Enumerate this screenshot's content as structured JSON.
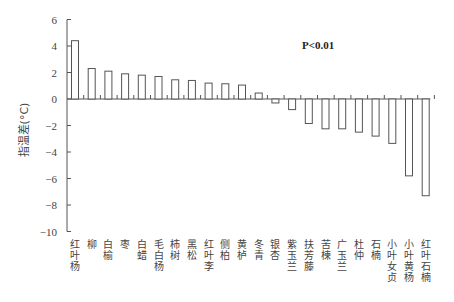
{
  "chart_data": {
    "type": "bar",
    "title": "",
    "xlabel": "",
    "ylabel": "指温差(°C)",
    "ylim": [
      -10,
      6
    ],
    "yticks": [
      6,
      4,
      2,
      0,
      -2,
      -4,
      -6,
      -8,
      -10
    ],
    "grid": false,
    "legend": null,
    "annotation": "P<0.01",
    "categories": [
      "红叶杨",
      "柳",
      "白榆",
      "枣",
      "白蜡",
      "毛白杨",
      "柿树",
      "黑松",
      "红叶李",
      "侧柏",
      "黄栌",
      "冬青",
      "银杏",
      "紫玉兰",
      "扶芳藤",
      "苦楝",
      "广玉兰",
      "杜仲",
      "石楠",
      "小叶女贞",
      "小叶黄杨",
      "红叶石楠"
    ],
    "values": [
      4.4,
      2.3,
      2.1,
      1.9,
      1.8,
      1.7,
      1.45,
      1.4,
      1.2,
      1.15,
      1.05,
      0.45,
      -0.3,
      -0.8,
      -1.85,
      -2.25,
      -2.25,
      -2.5,
      -2.8,
      -3.35,
      -5.8,
      -7.3
    ]
  },
  "colors": {
    "bar_fill": "#ffffff",
    "bar_stroke": "#555555",
    "axis": "#555555"
  }
}
